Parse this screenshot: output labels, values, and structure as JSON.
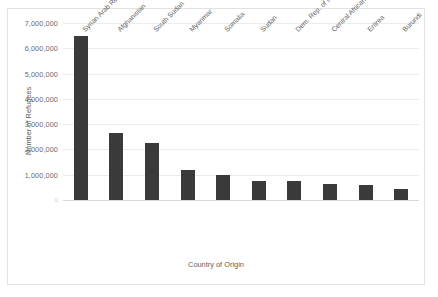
{
  "chart_data": {
    "type": "bar",
    "title": "",
    "xlabel": "Country of Origin",
    "ylabel": "Number of Refugees",
    "categories": [
      "Syrian Arab Rep.",
      "Afghanistan",
      "South Sudan",
      "Myanmar",
      "Somalia",
      "Sudan",
      "Dem. Rep. of the Congo",
      "Central African Rep.",
      "Eritrea",
      "Burundi"
    ],
    "values": [
      6470000,
      2670000,
      2250000,
      1180000,
      990000,
      770000,
      750000,
      620000,
      580000,
      440000
    ],
    "ylim": [
      0,
      7000000
    ],
    "ytick_labels": [
      "0",
      "1,000,000",
      "2,000,000",
      "3,000,000",
      "4,000,000",
      "5,000,000",
      "6,000,000",
      "7,000,000"
    ],
    "ytick_values": [
      0,
      1000000,
      2000000,
      3000000,
      4000000,
      5000000,
      6000000,
      7000000
    ],
    "grid": true,
    "legend": "none",
    "bar_color": "#3a3a3a",
    "gridline_color": "#ececec",
    "border_color": "#e2e2e2"
  }
}
